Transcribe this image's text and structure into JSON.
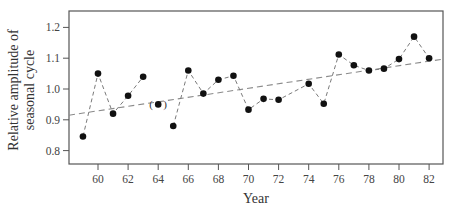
{
  "chart_data": {
    "type": "line",
    "title": "",
    "xlabel": "Year",
    "ylabel": [
      "Relative amplitude of",
      "seasonal cycle"
    ],
    "xlim": [
      1958.2,
      1983
    ],
    "ylim": [
      0.745,
      1.255
    ],
    "x_ticks": [
      60,
      62,
      64,
      66,
      68,
      70,
      72,
      74,
      76,
      78,
      80,
      82
    ],
    "y_ticks": [
      0.8,
      0.9,
      1.0,
      1.1,
      1.2
    ],
    "y_tick_labels": [
      "0.8",
      "0.9",
      "1.0",
      "1.1",
      "1.2"
    ],
    "grid": false,
    "legend": null,
    "series": [
      {
        "name": "Relative amplitude of seasonal cycle",
        "style": "dashed line with filled circle markers",
        "points": [
          {
            "year": 1959,
            "value": 0.846
          },
          {
            "year": 1960,
            "value": 1.05
          },
          {
            "year": 1961,
            "value": 0.92
          },
          {
            "year": 1962,
            "value": 0.978
          },
          {
            "year": 1963,
            "value": 1.04
          },
          {
            "year": 1964,
            "value": 0.95,
            "parenthesized": true,
            "connected": false
          },
          {
            "year": 1965,
            "value": 0.88
          },
          {
            "year": 1966,
            "value": 1.06
          },
          {
            "year": 1967,
            "value": 0.985
          },
          {
            "year": 1968,
            "value": 1.03
          },
          {
            "year": 1969,
            "value": 1.043
          },
          {
            "year": 1970,
            "value": 0.933
          },
          {
            "year": 1971,
            "value": 0.968
          },
          {
            "year": 1972,
            "value": 0.965
          },
          {
            "year": 1974,
            "value": 1.017
          },
          {
            "year": 1975,
            "value": 0.952
          },
          {
            "year": 1976,
            "value": 1.112
          },
          {
            "year": 1977,
            "value": 1.077
          },
          {
            "year": 1978,
            "value": 1.06
          },
          {
            "year": 1979,
            "value": 1.066
          },
          {
            "year": 1980,
            "value": 1.097
          },
          {
            "year": 1981,
            "value": 1.17
          },
          {
            "year": 1982,
            "value": 1.1
          }
        ]
      },
      {
        "name": "Linear trend",
        "style": "dashed straight line",
        "points": [
          {
            "year": 1958.2,
            "value": 0.915
          },
          {
            "year": 1983,
            "value": 1.097
          }
        ]
      }
    ],
    "annotations": [
      "1964 point shown in parentheses"
    ]
  },
  "labels": {
    "xlabel": "Year",
    "ylabel_line1": "Relative amplitude of",
    "ylabel_line2": "seasonal cycle",
    "paren_open": "(",
    "paren_close": ")"
  },
  "colors": {
    "marker": "#111111",
    "line": "#7a7a7a",
    "axis": "#555555"
  }
}
